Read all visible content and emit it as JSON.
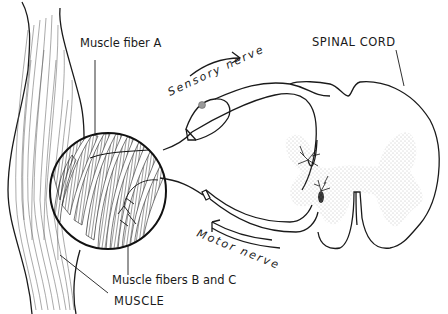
{
  "figure": {
    "type": "anatomical line drawing",
    "colors": {
      "ink": "#1a1a1a",
      "background": "#ffffff",
      "stipple": "#8a8a8a"
    }
  },
  "labels": {
    "muscle_fiber_a": "Muscle fiber A",
    "sensory_nerve": "Sensory nerve",
    "spinal_cord": "SPINAL CORD",
    "motor_nerve": "Motor nerve",
    "muscle_fibers_bc": "Muscle fibers B and C",
    "muscle": "MUSCLE"
  },
  "arrows": {
    "sensory_direction": "toward spinal cord",
    "motor_direction": "toward muscle"
  }
}
